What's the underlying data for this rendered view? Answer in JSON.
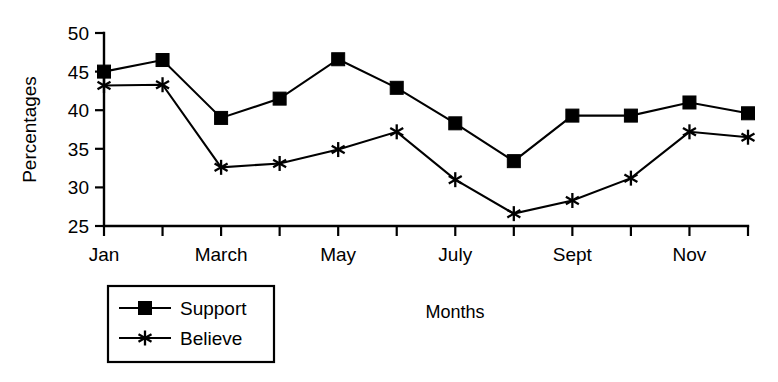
{
  "chart_data": {
    "type": "line",
    "title": "",
    "xlabel": "Months",
    "ylabel": "Percentages",
    "ylim": [
      25,
      50
    ],
    "yticks": [
      25,
      30,
      35,
      40,
      45,
      50
    ],
    "ytick_labels": [
      "25",
      "30",
      "35",
      "40",
      "45",
      "50"
    ],
    "grid": false,
    "legend_position": "bottom-left",
    "categories": [
      "Jan",
      "Feb",
      "March",
      "April",
      "May",
      "June",
      "July",
      "Aug",
      "Sept",
      "Oct",
      "Nov",
      "Dec"
    ],
    "xtick_labels": [
      "Jan",
      "",
      "March",
      "",
      "May",
      "",
      "July",
      "",
      "Sept",
      "",
      "Nov",
      ""
    ],
    "series": [
      {
        "name": "Support",
        "marker": "filled-square",
        "values": [
          45.0,
          46.5,
          39.0,
          41.5,
          46.6,
          42.9,
          38.3,
          33.4,
          39.3,
          39.3,
          41.0,
          39.6
        ]
      },
      {
        "name": "Believe",
        "marker": "asterisk",
        "values": [
          43.2,
          43.3,
          32.6,
          33.1,
          34.9,
          37.2,
          31.0,
          26.6,
          28.3,
          31.2,
          37.2,
          36.5
        ]
      }
    ]
  },
  "axes": {
    "y_axis_title": "Percentages",
    "x_axis_title": "Months"
  },
  "legend": {
    "items": [
      {
        "label": "Support"
      },
      {
        "label": "Believe"
      }
    ]
  },
  "colors": {
    "ink": "#000000",
    "background": "#ffffff"
  }
}
